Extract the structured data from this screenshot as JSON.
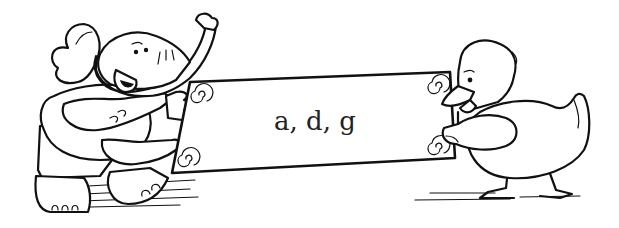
{
  "illustration": {
    "description": "Cartoon line art: an elephant and a duck holding a sign",
    "characters": [
      "elephant",
      "duck"
    ],
    "sign": {
      "text": "a, d, g"
    },
    "colors": {
      "ink": "#111111",
      "background": "#ffffff"
    }
  }
}
